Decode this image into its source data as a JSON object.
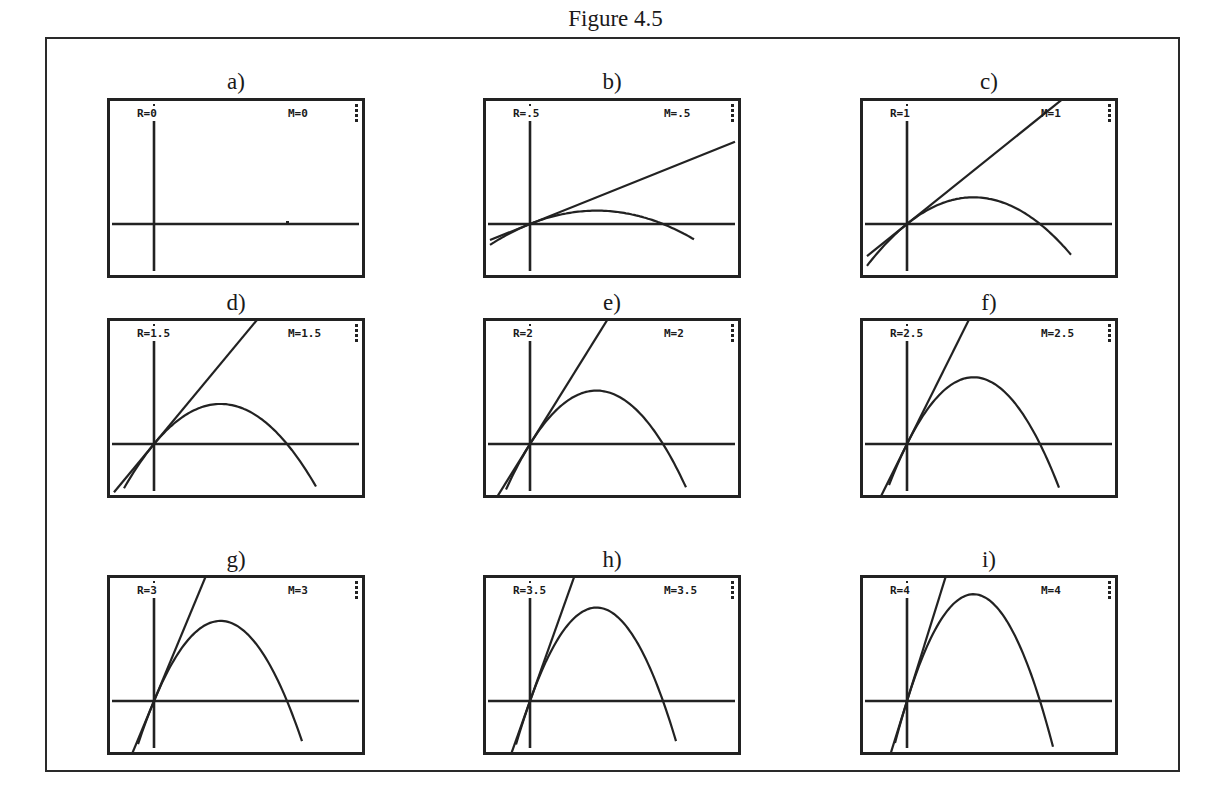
{
  "figure": {
    "title": "Figure 4.5"
  },
  "chart_data": {
    "type": "line",
    "title": "Figure 4.5",
    "xlabel": "",
    "ylabel": "",
    "grid": false,
    "legend": "none",
    "window": {
      "origin_px": [
        47,
        126
      ],
      "root_px": 180,
      "px_per_unit_height_at_R1": 26.7
    },
    "panels": [
      {
        "id": "a",
        "label": "a)",
        "R": "0",
        "M": "0",
        "r": 0,
        "m": 0
      },
      {
        "id": "b",
        "label": "b)",
        "R": ".5",
        "M": ".5",
        "r": 0.5,
        "m": 0.5
      },
      {
        "id": "c",
        "label": "c)",
        "R": "1",
        "M": "1",
        "r": 1,
        "m": 1
      },
      {
        "id": "d",
        "label": "d)",
        "R": "1.5",
        "M": "1.5",
        "r": 1.5,
        "m": 1.5
      },
      {
        "id": "e",
        "label": "e)",
        "R": "2",
        "M": "2",
        "r": 2,
        "m": 2
      },
      {
        "id": "f",
        "label": "f)",
        "R": "2.5",
        "M": "2.5",
        "r": 2.5,
        "m": 2.5
      },
      {
        "id": "g",
        "label": "g)",
        "R": "3",
        "M": "3",
        "r": 3,
        "m": 3
      },
      {
        "id": "h",
        "label": "h)",
        "R": "3.5",
        "M": "3.5",
        "r": 3.5,
        "m": 3.5
      },
      {
        "id": "i",
        "label": "i)",
        "R": "4",
        "M": "4",
        "r": 4,
        "m": 4
      }
    ],
    "series": [
      {
        "name": "parabola",
        "values_peak_height_px": [
          0,
          13.3,
          26.7,
          40,
          53.3,
          66.7,
          80,
          93.3,
          106.7
        ]
      },
      {
        "name": "tangent line y = M·x",
        "slopes": [
          0,
          0.5,
          1,
          1.5,
          2,
          2.5,
          3,
          3.5,
          4
        ]
      }
    ]
  },
  "panels_text": {
    "a": {
      "label": "a)",
      "r_text": "R=0",
      "m_text": "M=0"
    },
    "b": {
      "label": "b)",
      "r_text": "R=.5",
      "m_text": "M=.5"
    },
    "c": {
      "label": "c)",
      "r_text": "R=1",
      "m_text": "M=1"
    },
    "d": {
      "label": "d)",
      "r_text": "R=1.5",
      "m_text": "M=1.5"
    },
    "e": {
      "label": "e)",
      "r_text": "R=2",
      "m_text": "M=2"
    },
    "f": {
      "label": "f)",
      "r_text": "R=2.5",
      "m_text": "M=2.5"
    },
    "g": {
      "label": "g)",
      "r_text": "R=3",
      "m_text": "M=3"
    },
    "h": {
      "label": "h)",
      "r_text": "R=3.5",
      "m_text": "M=3.5"
    },
    "i": {
      "label": "i)",
      "r_text": "R=4",
      "m_text": "M=4"
    }
  },
  "colors": {
    "ink": "#222222",
    "background": "#ffffff"
  }
}
